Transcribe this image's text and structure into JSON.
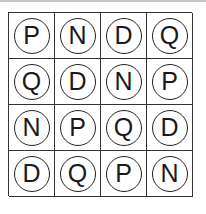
{
  "grid": {
    "rows": [
      [
        "P",
        "N",
        "D",
        "Q"
      ],
      [
        "Q",
        "D",
        "N",
        "P"
      ],
      [
        "N",
        "P",
        "Q",
        "D"
      ],
      [
        "D",
        "Q",
        "P",
        "N"
      ]
    ]
  }
}
